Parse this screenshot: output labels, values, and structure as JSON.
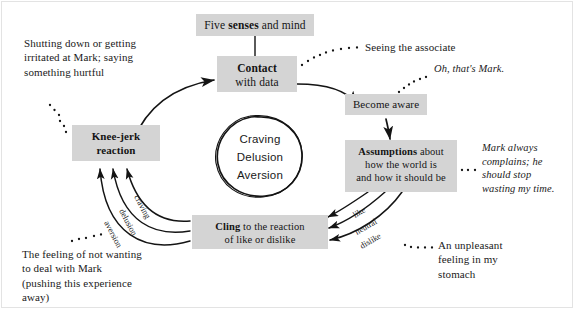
{
  "diagram": {
    "frame_color": "#e3e3e3",
    "box_fill": "#d4d4d4",
    "ink_color": "#141414",
    "boxes": {
      "five_senses": {
        "lead": "Five ",
        "bold": "senses",
        "tail": " and mind"
      },
      "contact": {
        "bold": "Contact",
        "line2": "with data"
      },
      "become_aware": {
        "label": "Become aware"
      },
      "assumptions": {
        "bold": "Assumptions",
        "tail": " about",
        "line2": "how the world is",
        "line3": "and how it should be"
      },
      "cling": {
        "bold": "Cling",
        "tail": " to the reaction",
        "line2": "of like or dislike"
      },
      "knee_jerk": {
        "line1": "Knee-jerk",
        "line2": "reaction"
      }
    },
    "circle": {
      "items": [
        "Craving",
        "Delusion",
        "Aversion"
      ]
    },
    "notes": {
      "shutting_down": "Shutting down or getting irritated at Mark; saying something hurtful",
      "seeing_associate": "Seeing the associate",
      "oh_thats_mark": "Oh, that's Mark.",
      "mark_always": "Mark always complains; he should stop wasting my time.",
      "unpleasant_feeling": "An unpleasant feeling in my stomach",
      "feeling_of_not_wanting": "The feeling of not wanting to deal with Mark (pushing this experience away)"
    },
    "arc_labels": {
      "left": [
        "craving",
        "delusion",
        "aversion"
      ],
      "right": [
        "like",
        "neutral",
        "dislike"
      ]
    }
  }
}
